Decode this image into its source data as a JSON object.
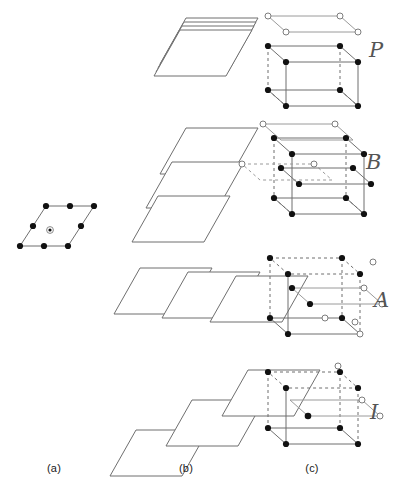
{
  "figure": {
    "background_color": "#ffffff",
    "line_color": "#777777",
    "solid_node_color": "#111111",
    "open_node_color": "#ffffff",
    "open_node_stroke": "#777777",
    "dashed_color": "#999999"
  },
  "columns": [
    {
      "id": "a",
      "label": "(a)",
      "caption_x": 54,
      "caption_y": 466
    },
    {
      "id": "b",
      "label": "(b)",
      "caption_x": 186,
      "caption_y": 466
    },
    {
      "id": "c",
      "label": "(c)",
      "caption_x": 312,
      "caption_y": 466
    }
  ],
  "rows": [
    {
      "index": 1,
      "centring_letter": "P",
      "letter_x": 369,
      "letter_y": 38,
      "stacking": "planes stacked directly above one another with no lateral shift",
      "offset_x": 0,
      "offset_y": 0,
      "plane_count": 4,
      "cell_interior_nodes": "none"
    },
    {
      "index": 2,
      "centring_letter": "B",
      "letter_x": 366,
      "letter_y": 150,
      "stacking": "planes shifted downward along the b direction between layers",
      "offset_x": -14,
      "offset_y": 34,
      "plane_count": 3,
      "cell_interior_nodes": "B-face centred"
    },
    {
      "index": 3,
      "centring_letter": "A",
      "letter_x": 374,
      "letter_y": 288,
      "stacking": "planes shifted sideways to the right between layers",
      "offset_x": 48,
      "offset_y": 4,
      "plane_count": 3,
      "cell_interior_nodes": "A-face centred"
    },
    {
      "index": 4,
      "centring_letter": "I",
      "letter_x": 370,
      "letter_y": 400,
      "stacking": "planes shifted diagonally up and to the right between layers",
      "offset_x": 56,
      "offset_y": -30,
      "plane_count": 3,
      "cell_interior_nodes": "body centred"
    }
  ],
  "lattice_plane": {
    "description": "two dimensional oblique lattice net drawn as a parallelogram",
    "corner_nodes": 4,
    "edge_midpoint_nodes": 4,
    "centre_node": 1,
    "centre_node_style": "open ringed dot"
  },
  "legend": {
    "solid_node": "lattice point in the lower reference layer",
    "open_node": "lattice point in the translated upper layer"
  }
}
